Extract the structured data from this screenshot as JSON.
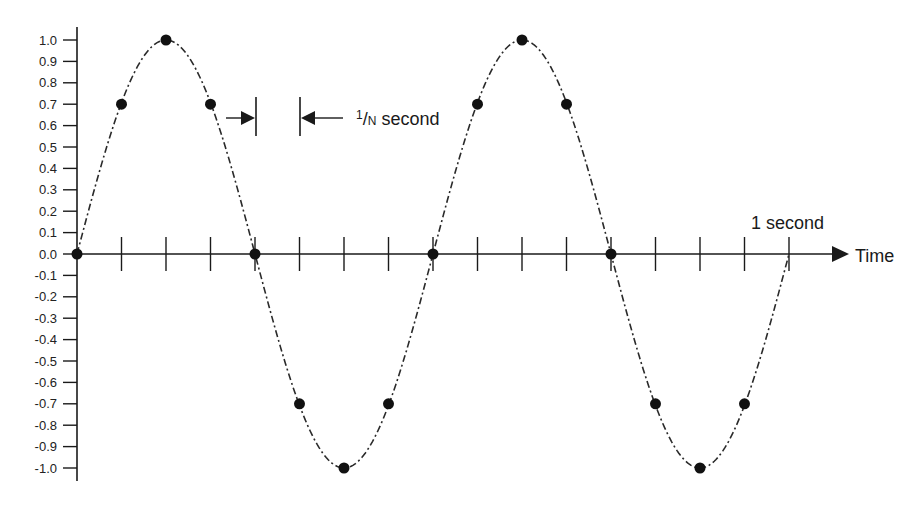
{
  "chart_data": {
    "type": "line",
    "title": "",
    "xlabel": "Time",
    "ylabel": "",
    "ylim": [
      -1.0,
      1.0
    ],
    "yticks": [
      "1.0",
      "0.9",
      "0.8",
      "0.7",
      "0.6",
      "0.5",
      "0.4",
      "0.3",
      "0.2",
      "0.1",
      "0.0",
      "-0.1",
      "-0.2",
      "-0.3",
      "-0.4",
      "-0.5",
      "-0.6",
      "-0.7",
      "-0.8",
      "-0.9",
      "-1.0"
    ],
    "x_ticks_count": 16,
    "x_range_seconds": [
      0,
      1
    ],
    "cycles_per_second": 2,
    "grid": false,
    "legend": null,
    "series": [
      {
        "name": "sine wave (continuous)",
        "style": "dash-dot",
        "function": "sin(2*pi*2*t)"
      },
      {
        "name": "samples",
        "style": "dots",
        "x": [
          0,
          0.0625,
          0.125,
          0.1875,
          0.25,
          0.3125,
          0.375,
          0.4375,
          0.5,
          0.5625,
          0.625,
          0.6875,
          0.75,
          0.8125,
          0.875,
          0.9375
        ],
        "values": [
          0.0,
          0.7,
          1.0,
          0.7,
          0.0,
          -0.7,
          -1.0,
          -0.7,
          0.0,
          0.7,
          1.0,
          0.7,
          0.0,
          -0.7,
          -1.0,
          -0.7
        ]
      }
    ],
    "annotations": [
      {
        "text_sup": "1",
        "text_sub": "N",
        "text_main": " second",
        "meaning": "sample interval 1/N second",
        "between_ticks": [
          4,
          5
        ]
      },
      {
        "text": "1 second",
        "at_tick": 16
      }
    ]
  },
  "labels": {
    "time_axis": "Time",
    "one_second": "1 second",
    "interval_sup": "1",
    "interval_slash": "/",
    "interval_sub": "N",
    "interval_word": "second"
  }
}
